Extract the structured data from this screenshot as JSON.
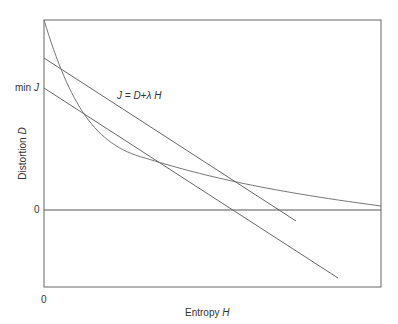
{
  "diagram": {
    "title": "",
    "xlabel": "Entropy",
    "xlabel_var": "H",
    "ylabel": "Distortion",
    "ylabel_var": "D",
    "y_tick_minJ": "min",
    "y_tick_minJ_var": "J",
    "y_tick_zero": "0",
    "x_tick_zero": "0",
    "line_label": "J = D+λ H",
    "elements": [
      {
        "type": "curve",
        "name": "rate-distortion curve",
        "description": "convex decreasing curve from top-left approaching zero asymptotically"
      },
      {
        "type": "line",
        "name": "cost line (higher)",
        "description": "straight line J = D + λH intersecting curve"
      },
      {
        "type": "line",
        "name": "cost line (tangent, min J)",
        "description": "parallel line tangent to curve, intercept at min J"
      },
      {
        "type": "line",
        "name": "zero distortion axis"
      }
    ],
    "colors": {
      "line": "#555555",
      "frame": "#555555"
    }
  }
}
